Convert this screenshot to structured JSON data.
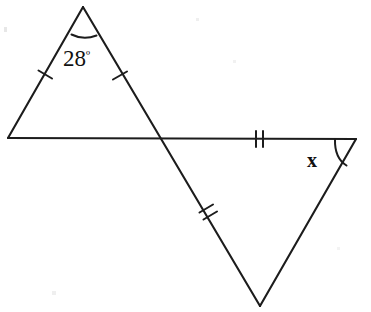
{
  "figure": {
    "kind": "geometry-diagram",
    "background_color": "#ffffff",
    "stroke_color": "#1c1c1c",
    "text_color": "#111111"
  },
  "labels": {
    "angle_top": "28",
    "angle_top_degree_symbol": "º",
    "angle_top_full": "28º",
    "angle_right": "x"
  },
  "vertices": {
    "apex": {
      "name": "apex",
      "x": 83,
      "y": 7
    },
    "left": {
      "name": "left-vertex",
      "x": 8,
      "y": 138
    },
    "crossing": {
      "name": "crossing-point",
      "x": 160,
      "y": 138
    },
    "right": {
      "name": "right-vertex",
      "x": 356,
      "y": 139
    },
    "bottom": {
      "name": "bottom-vertex",
      "x": 260,
      "y": 306
    }
  },
  "segments": [
    {
      "name": "upper-left-leg",
      "from": "left",
      "to": "apex",
      "ticks": 1
    },
    {
      "name": "apex-to-bottom-line",
      "from": "apex",
      "to": "bottom",
      "ticks": 1,
      "tick_position": "upper-portion"
    },
    {
      "name": "horizontal-baseline",
      "from": "left",
      "to": "right",
      "ticks": 2,
      "tick_position": "right-portion"
    },
    {
      "name": "lower-right-leg",
      "from": "bottom",
      "to": "right",
      "ticks": 0
    }
  ],
  "tick_marks": [
    {
      "name": "tick-upper-left-leg",
      "count": 1,
      "x": 45,
      "y": 75
    },
    {
      "name": "tick-upper-right-leg",
      "count": 1,
      "x": 120,
      "y": 75
    },
    {
      "name": "tick-horizontal-right",
      "count": 2,
      "x": 259,
      "y": 139
    },
    {
      "name": "tick-diagonal-lower",
      "count": 2,
      "x": 207,
      "y": 214
    }
  ],
  "angle_arcs": [
    {
      "name": "arc-apex-28-degrees",
      "at_vertex": "apex",
      "label": "28º"
    },
    {
      "name": "arc-right-x",
      "at_vertex": "right",
      "label": "x"
    }
  ]
}
